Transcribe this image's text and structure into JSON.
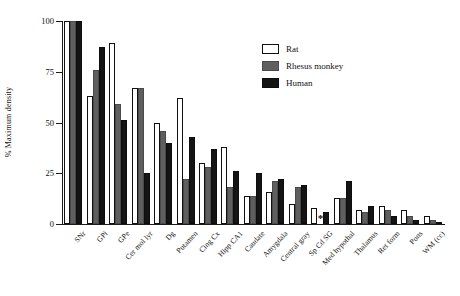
{
  "chart_data": {
    "type": "bar",
    "title": "",
    "xlabel": "",
    "ylabel": "% Maximum density",
    "ylim": [
      0,
      100
    ],
    "yticks": [
      0,
      25,
      50,
      75,
      100
    ],
    "ytick_labels": [
      "0",
      "25",
      "50",
      "75",
      "100"
    ],
    "grid": false,
    "legend_position": "upper right",
    "categories": [
      "SNr",
      "GPi",
      "GPe",
      "Cer mol lyr",
      "Dg",
      "Putamen",
      "Cing Cx",
      "Hipp CA1",
      "Caudate",
      "Amygdala",
      "Central gray",
      "Sp Cd SG",
      "Med hypothal",
      "Thalamus",
      "Ret form",
      "Pons",
      "WM (cc)"
    ],
    "series": [
      {
        "name": "Rat",
        "color": "#ffffff",
        "values": [
          100,
          63,
          89,
          67,
          50,
          62,
          30,
          38,
          14,
          16,
          10,
          8,
          13,
          7,
          9,
          7,
          4
        ]
      },
      {
        "name": "Rhesus monkey",
        "color": "#5f5f5f",
        "values": [
          100,
          76,
          59,
          67,
          46,
          22,
          28,
          18,
          14,
          21,
          18,
          null,
          13,
          6,
          7,
          4,
          2
        ]
      },
      {
        "name": "Human",
        "color": "#141414",
        "values": [
          100,
          87,
          51,
          25,
          40,
          43,
          37,
          26,
          25,
          22,
          19,
          6,
          21,
          9,
          4,
          2,
          1
        ]
      }
    ],
    "annotations": [
      {
        "text": "*",
        "category": "Sp Cd SG",
        "series": "Rhesus monkey",
        "meaning": "no data / not measured"
      }
    ]
  },
  "legend": {
    "items": [
      {
        "label": "Rat",
        "swatch": "white-square-icon"
      },
      {
        "label": "Rhesus monkey",
        "swatch": "gray-square-icon"
      },
      {
        "label": "Human",
        "swatch": "black-square-icon"
      }
    ]
  }
}
